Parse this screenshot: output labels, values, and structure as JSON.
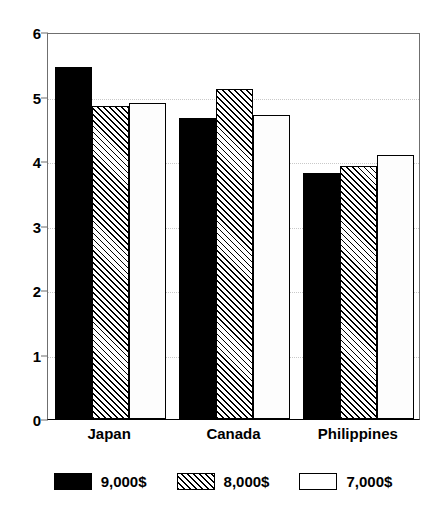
{
  "chart_data": {
    "type": "bar",
    "title": "",
    "subtitle": "",
    "xlabel": "",
    "ylabel": "",
    "categories": [
      "Japan",
      "Canada",
      "Philippines"
    ],
    "series": [
      {
        "name": "9,000$",
        "style": "solid-black",
        "values": [
          5.46,
          4.67,
          3.81
        ]
      },
      {
        "name": "8,000$",
        "style": "diagonal-hatch",
        "values": [
          4.85,
          5.12,
          3.92
        ]
      },
      {
        "name": "7,000$",
        "style": "white-outline",
        "values": [
          4.9,
          4.71,
          4.09
        ]
      }
    ],
    "ylim": [
      0,
      6
    ],
    "ytick_labels": [
      "0",
      "1",
      "2",
      "3",
      "4",
      "5",
      "6"
    ],
    "ytick_values": [
      0,
      1,
      2,
      3,
      4,
      5,
      6
    ],
    "grid": true,
    "grid_axis": "y",
    "legend_position": "bottom",
    "colors": {
      "series_1": "#000000",
      "series_2": "#000000",
      "series_3": "#ffffff",
      "axis": "#000000",
      "grid": "#c9c9c9"
    }
  },
  "legend": {
    "items": [
      {
        "label": "9,000$"
      },
      {
        "label": "8,000$"
      },
      {
        "label": "7,000$"
      }
    ]
  }
}
